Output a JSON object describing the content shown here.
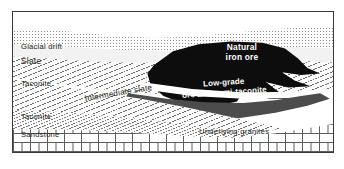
{
  "figure": {
    "type": "geological-cross-section",
    "caption": ""
  },
  "strata": [
    {
      "id": "sky",
      "label": "",
      "fill": "white",
      "pattern": "none"
    },
    {
      "id": "glacial-drift",
      "label": "Glacial drift",
      "fill": "#fdfdfd",
      "pattern": "stipple"
    },
    {
      "id": "slate",
      "label": "Slate",
      "fill": "#f2f2f2",
      "pattern": "plain"
    },
    {
      "id": "taconite-upper",
      "label": "Taconite",
      "fill": "#fbfbfb",
      "pattern": "diagonal-hatch"
    },
    {
      "id": "intermediate-slate",
      "label": "Intermediate slate",
      "fill": "#ffffff",
      "pattern": "plain"
    },
    {
      "id": "natural-iron-ore",
      "label": "Natural iron ore",
      "fill": "#0d0d0d",
      "pattern": "solid"
    },
    {
      "id": "low-grade-ore",
      "label": "Low-grade ore and semi-taconite",
      "fill": "#4c4c4c",
      "pattern": "solid"
    },
    {
      "id": "taconite-lower",
      "label": "Taconite",
      "fill": "#fbfbfb",
      "pattern": "diagonal-hatch"
    },
    {
      "id": "sandstone",
      "label": "Sandstone",
      "fill": "#fbfbfb",
      "pattern": "fine-hatch"
    },
    {
      "id": "granite",
      "label": "Underlying granites",
      "fill": "#fefefe",
      "pattern": "brick"
    }
  ],
  "labels": {
    "glacial_drift": "Glacial drift",
    "slate": "Slate",
    "taconite_upper": "Taconite",
    "intermediate_slate": "Intermediate slate",
    "natural_iron_ore_line1": "Natural",
    "natural_iron_ore_line2": "iron ore",
    "low_grade_line1": "Low-grade",
    "low_grade_line2": "ore and semi-taconite",
    "taconite_lower": "Taconite",
    "sandstone": "Sandstone",
    "underlying_granites": "Underlying  granites"
  },
  "colors": {
    "frame": "#3a3a3a",
    "ore": "#0d0d0d",
    "low_grade": "#4c4c4c",
    "hatch": "#6f6f6f",
    "brick": "#5e5e5e",
    "text_dark": "#1a1a1a",
    "text_light": "#ffffff"
  }
}
